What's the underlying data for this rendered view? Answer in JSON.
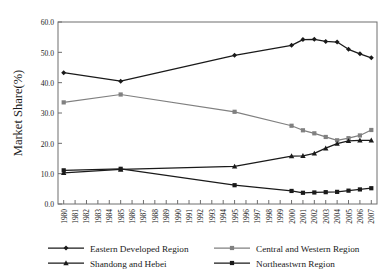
{
  "chart_data": {
    "type": "line",
    "title": "",
    "xlabel": "",
    "ylabel": "Market Share(%)",
    "ylim": [
      0,
      60
    ],
    "ytick_labels": [
      "0.0",
      "10.0",
      "20.0",
      "30.0",
      "40.0",
      "50.0",
      "60.0"
    ],
    "ytick_values": [
      0,
      10,
      20,
      30,
      40,
      50,
      60
    ],
    "grid": false,
    "legend_position": "bottom",
    "x": [
      1980,
      1981,
      1982,
      1983,
      1984,
      1985,
      1986,
      1987,
      1988,
      1989,
      1990,
      1991,
      1992,
      1993,
      1994,
      1995,
      1996,
      1997,
      1998,
      1999,
      2000,
      2001,
      2002,
      2003,
      2004,
      2005,
      2006,
      2007
    ],
    "xtick_labels": [
      "1980",
      "1981",
      "1982",
      "1983",
      "1984",
      "1985",
      "1986",
      "1987",
      "1988",
      "1989",
      "1990",
      "1991",
      "1992",
      "1993",
      "1994",
      "1995",
      "1996",
      "1997",
      "1998",
      "1999",
      "2000",
      "2001",
      "2002",
      "2003",
      "2004",
      "2005",
      "2006",
      "2007"
    ],
    "series": [
      {
        "name": "Eastern Developed Region",
        "color": "#1a1a1a",
        "marker": "diamond",
        "x": [
          1980,
          1985,
          1995,
          2000,
          2001,
          2002,
          2003,
          2004,
          2005,
          2006,
          2007
        ],
        "values": [
          43.3,
          40.5,
          49.0,
          52.3,
          54.2,
          54.3,
          53.6,
          53.4,
          51.0,
          49.5,
          48.2
        ]
      },
      {
        "name": "Central and Western Region",
        "color": "#808080",
        "marker": "square",
        "x": [
          1980,
          1985,
          1995,
          2000,
          2001,
          2002,
          2003,
          2004,
          2005,
          2006,
          2007
        ],
        "values": [
          33.5,
          36.1,
          30.4,
          25.8,
          24.3,
          23.3,
          22.1,
          21.0,
          21.7,
          22.6,
          24.4
        ]
      },
      {
        "name": "Shandong and Hebei",
        "color": "#1a1a1a",
        "marker": "triangle",
        "x": [
          1980,
          1985,
          1995,
          2000,
          2001,
          2002,
          2003,
          2004,
          2005,
          2006,
          2007
        ],
        "values": [
          10.3,
          11.4,
          12.4,
          15.8,
          15.9,
          16.7,
          18.4,
          19.9,
          20.8,
          21.0,
          21.0
        ]
      },
      {
        "name": "Northeastwrn Region",
        "color": "#1a1a1a",
        "marker": "square",
        "x": [
          1980,
          1985,
          1995,
          2000,
          2001,
          2002,
          2003,
          2004,
          2005,
          2006,
          2007
        ],
        "values": [
          11.1,
          11.6,
          6.2,
          4.3,
          3.7,
          3.8,
          3.9,
          4.0,
          4.4,
          4.8,
          5.2
        ]
      }
    ],
    "legend": [
      "Eastern Developed Region",
      "Central and Western Region",
      "Shandong and Hebei",
      "Northeastwrn Region"
    ]
  }
}
